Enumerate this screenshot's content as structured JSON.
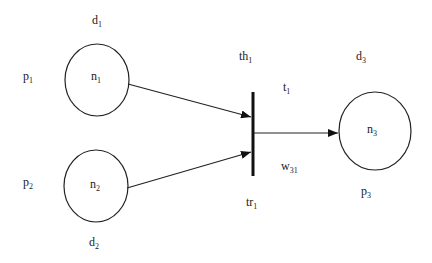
{
  "diagram": {
    "type": "petri-net",
    "places": [
      {
        "id": "n1",
        "name": "n",
        "sub": "1",
        "label": "p",
        "label_sub": "1",
        "delay": "d",
        "delay_sub": "1"
      },
      {
        "id": "n2",
        "name": "n",
        "sub": "2",
        "label": "p",
        "label_sub": "2",
        "delay": "d",
        "delay_sub": "2"
      },
      {
        "id": "n3",
        "name": "n",
        "sub": "3",
        "label": "p",
        "label_sub": "3",
        "delay": "d",
        "delay_sub": "3"
      }
    ],
    "transition": {
      "id": "t1",
      "name": "t",
      "sub": "1",
      "threshold": "th",
      "threshold_sub": "1",
      "label": "tr",
      "label_sub": "1"
    },
    "arcs": [
      {
        "from": "n1",
        "to": "t1"
      },
      {
        "from": "n2",
        "to": "t1"
      },
      {
        "from": "t1",
        "to": "n3",
        "weight": "w",
        "weight_sub": "31"
      }
    ]
  }
}
